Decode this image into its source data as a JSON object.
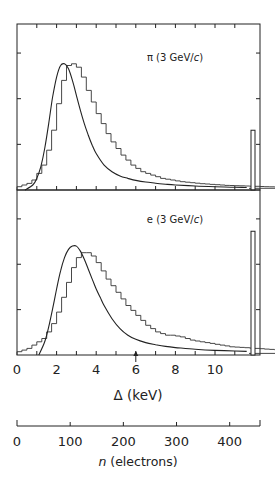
{
  "chart_data": {
    "type": "bar",
    "xlabel": "Δ (keV)",
    "xlim": [
      0,
      12.2
    ],
    "x_ticks": [
      0,
      1,
      2,
      3,
      4,
      5,
      6,
      7,
      8,
      9,
      10,
      11
    ],
    "x_tick_labels": [
      "0",
      "2",
      "4",
      "6",
      "8",
      "10"
    ],
    "x_tick_label_values": [
      0,
      2,
      4,
      6,
      8,
      10
    ],
    "marker_arrow_at": 6,
    "secondary_axis": {
      "label_prefix": "n",
      "label_suffix": " (electrons)",
      "label": "n (electrons)",
      "tick_labels": [
        "0",
        "100",
        "200",
        "300",
        "400"
      ],
      "tick_values": [
        0,
        100,
        200,
        300,
        400
      ],
      "max": 457
    },
    "y_ticks_norm": [
      0.275,
      0.55,
      0.825
    ],
    "ylabel": "",
    "grid": false,
    "panels": [
      {
        "label": "π (3 GeV/c)",
        "label_main": "π (3 GeV/",
        "label_italic": "c",
        "label_close": ")",
        "overflow_bar": 0.36,
        "histogram": {
          "bin_width": 0.25,
          "x_start": 0,
          "values": [
            0.02,
            0.03,
            0.04,
            0.06,
            0.1,
            0.15,
            0.24,
            0.36,
            0.52,
            0.66,
            0.75,
            0.76,
            0.74,
            0.68,
            0.6,
            0.53,
            0.46,
            0.4,
            0.34,
            0.29,
            0.25,
            0.21,
            0.18,
            0.15,
            0.13,
            0.11,
            0.1,
            0.09,
            0.08,
            0.07,
            0.065,
            0.06,
            0.055,
            0.05,
            0.047,
            0.044,
            0.041,
            0.038,
            0.036,
            0.034,
            0.032,
            0.03,
            0.028,
            0.027,
            0.026,
            0.025,
            0.024,
            0.023,
            0.022,
            0.021,
            0.02,
            0.019,
            0.018,
            0.017,
            0.016,
            0.016,
            0.015,
            0.015,
            0.015,
            0.014,
            0.014,
            0.014,
            0.013,
            0.013,
            0.013,
            0.012,
            0.012,
            0.012,
            0.011,
            0.011,
            0.011,
            0.01,
            0.01,
            0.01,
            0.01,
            0.009,
            0.009,
            0.009,
            0.009,
            0.01,
            0.012,
            0.014,
            0.016,
            0.015,
            0.014,
            0.013,
            0.012,
            0.012,
            0.011,
            0.011,
            0.011,
            0.01,
            0.01,
            0.01,
            0.01
          ]
        },
        "curve": {
          "x": [
            0.4,
            0.8,
            1.0,
            1.2,
            1.4,
            1.6,
            1.8,
            2.0,
            2.2,
            2.4,
            2.6,
            2.8,
            3.0,
            3.2,
            3.4,
            3.6,
            3.8,
            4.0,
            4.4,
            4.8,
            5.2,
            5.6,
            6.0,
            6.5,
            7.0,
            7.5,
            8.0,
            9.0,
            10.0,
            11.0,
            11.6
          ],
          "y": [
            0.0,
            0.03,
            0.07,
            0.14,
            0.25,
            0.4,
            0.56,
            0.68,
            0.75,
            0.76,
            0.73,
            0.66,
            0.57,
            0.48,
            0.4,
            0.33,
            0.27,
            0.22,
            0.15,
            0.11,
            0.085,
            0.07,
            0.058,
            0.048,
            0.041,
            0.035,
            0.03,
            0.024,
            0.02,
            0.017,
            0.015
          ]
        }
      },
      {
        "label": "e (3 GeV/c)",
        "label_main": "e (3 GeV/",
        "label_italic": "c",
        "label_close": ")",
        "overflow_bar": 0.75,
        "histogram": {
          "bin_width": 0.25,
          "x_start": 0,
          "values": [
            0.02,
            0.03,
            0.04,
            0.06,
            0.08,
            0.1,
            0.14,
            0.19,
            0.26,
            0.35,
            0.44,
            0.53,
            0.59,
            0.62,
            0.62,
            0.6,
            0.56,
            0.51,
            0.46,
            0.42,
            0.38,
            0.34,
            0.3,
            0.27,
            0.24,
            0.21,
            0.18,
            0.16,
            0.14,
            0.13,
            0.12,
            0.12,
            0.115,
            0.11,
            0.1,
            0.09,
            0.085,
            0.08,
            0.075,
            0.07,
            0.065,
            0.06,
            0.055,
            0.05,
            0.048,
            0.046,
            0.044,
            0.042,
            0.04,
            0.038,
            0.036,
            0.034,
            0.032,
            0.03,
            0.03,
            0.032,
            0.034,
            0.032,
            0.03,
            0.028,
            0.026,
            0.025,
            0.025,
            0.026,
            0.028,
            0.03,
            0.028,
            0.026,
            0.024,
            0.022,
            0.02,
            0.019,
            0.018,
            0.017,
            0.016,
            0.015,
            0.014,
            0.014,
            0.013,
            0.012,
            0.012,
            0.012,
            0.011,
            0.011,
            0.011,
            0.01,
            0.01,
            0.01,
            0.01,
            0.01,
            0.01,
            0.01,
            0.01,
            0.01,
            0.01
          ]
        },
        "curve": {
          "x": [
            1.1,
            1.4,
            1.6,
            1.8,
            2.0,
            2.2,
            2.4,
            2.6,
            2.8,
            3.0,
            3.2,
            3.4,
            3.6,
            3.8,
            4.0,
            4.2,
            4.4,
            4.8,
            5.2,
            5.6,
            6.0,
            6.5,
            7.0,
            7.5,
            8.0,
            9.0,
            10.0,
            11.0,
            11.6
          ],
          "y": [
            0.0,
            0.08,
            0.17,
            0.28,
            0.4,
            0.51,
            0.59,
            0.64,
            0.66,
            0.66,
            0.63,
            0.58,
            0.52,
            0.46,
            0.4,
            0.35,
            0.3,
            0.22,
            0.16,
            0.12,
            0.095,
            0.075,
            0.062,
            0.052,
            0.045,
            0.035,
            0.028,
            0.024,
            0.022
          ]
        }
      }
    ]
  }
}
